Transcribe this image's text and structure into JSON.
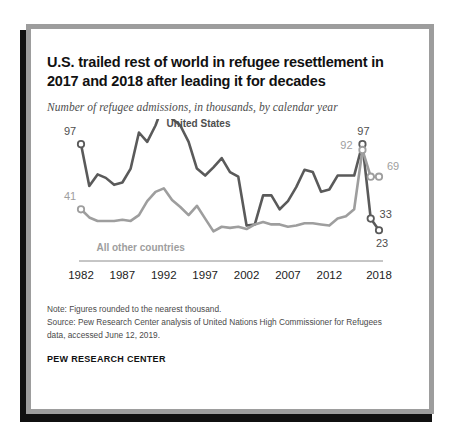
{
  "chart_data": {
    "type": "line",
    "title": "U.S. trailed rest of world in refugee resettlement in 2017 and 2018 after leading it for decades",
    "subtitle": "Number of refugee admissions, in thousands, by calendar year",
    "xlabel": "",
    "ylabel": "",
    "grid": false,
    "legend_position": "inline-annotation",
    "xlim": [
      1982,
      2018
    ],
    "ylim": [
      0,
      110
    ],
    "x": [
      1982,
      1983,
      1984,
      1985,
      1986,
      1987,
      1988,
      1989,
      1990,
      1991,
      1992,
      1993,
      1994,
      1995,
      1996,
      1997,
      1998,
      1999,
      2000,
      2001,
      2002,
      2003,
      2004,
      2005,
      2006,
      2007,
      2008,
      2009,
      2010,
      2011,
      2012,
      2013,
      2014,
      2015,
      2016,
      2017,
      2018
    ],
    "tick_labels": [
      "1982",
      "1987",
      "1992",
      "1997",
      "2002",
      "2007",
      "2012",
      "2018"
    ],
    "tick_values": [
      1982,
      1987,
      1992,
      1997,
      2002,
      2007,
      2012,
      2018
    ],
    "series": [
      {
        "name": "United States",
        "color": "#5a5a5a",
        "values": [
          97,
          61,
          71,
          68,
          62,
          64,
          76,
          107,
          99,
          113,
          132,
          119,
          113,
          99,
          76,
          70,
          77,
          85,
          73,
          69,
          27,
          28,
          53,
          53,
          41,
          48,
          60,
          75,
          73,
          56,
          58,
          70,
          70,
          70,
          97,
          33,
          23
        ]
      },
      {
        "name": "All other countries",
        "color": "#9e9e9e",
        "values": [
          41,
          34,
          31,
          31,
          31,
          32,
          31,
          36,
          48,
          56,
          59,
          49,
          43,
          36,
          44,
          33,
          22,
          26,
          25,
          26,
          24,
          28,
          30,
          28,
          28,
          26,
          27,
          29,
          29,
          28,
          27,
          33,
          35,
          41,
          92,
          69,
          69
        ]
      }
    ],
    "annotations": [
      {
        "text": "United States",
        "series": "United States"
      },
      {
        "text": "All other countries",
        "series": "All other countries"
      },
      {
        "text": "97",
        "year": 1982,
        "series": "United States"
      },
      {
        "text": "41",
        "year": 1982,
        "series": "All other countries"
      },
      {
        "text": "97",
        "year": 2016,
        "series": "United States"
      },
      {
        "text": "92",
        "year": 2016,
        "series": "All other countries"
      },
      {
        "text": "69",
        "year": 2018,
        "series": "All other countries"
      },
      {
        "text": "33",
        "year": 2017,
        "series": "United States"
      },
      {
        "text": "23",
        "year": 2018,
        "series": "United States"
      }
    ]
  },
  "footer": {
    "note": "Note: Figures rounded to the nearest thousand.",
    "source_line1": "Source: Pew Research Center analysis of United Nations High Commissioner for Refugees",
    "source_line2": "data, accessed June 12, 2019.",
    "brand": "PEW RESEARCH CENTER"
  }
}
